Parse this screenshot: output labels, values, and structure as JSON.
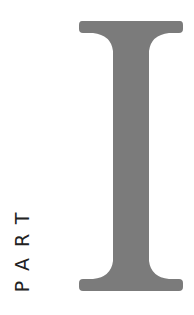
{
  "page": {
    "label": "PART",
    "numeral": "I",
    "colors": {
      "numeral_fill": "#7b7b7b",
      "label_text": "#222222",
      "background": "#ffffff"
    }
  }
}
